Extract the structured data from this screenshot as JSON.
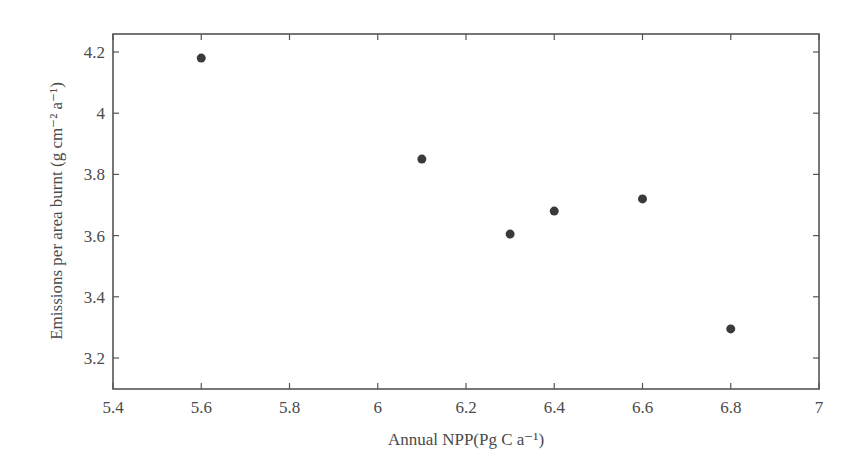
{
  "chart_data": {
    "type": "scatter",
    "title": "",
    "xlabel": "Annual NPP(Pg C a⁻¹)",
    "ylabel": "Emissions per area burnt  (g cm⁻² a⁻¹)",
    "xlim": [
      5.4,
      7.0
    ],
    "ylim": [
      3.1,
      4.25
    ],
    "xticks": [
      "5.4",
      "5.6",
      "5.8",
      "6",
      "6.2",
      "6.4",
      "6.6",
      "6.8",
      "7"
    ],
    "yticks": [
      "3.2",
      "3.4",
      "3.6",
      "3.8",
      "4",
      "4.2"
    ],
    "grid": false,
    "legend": null,
    "series": [
      {
        "name": "data",
        "x": [
          5.6,
          6.1,
          6.3,
          6.4,
          6.6,
          6.8
        ],
        "y": [
          4.18,
          3.85,
          3.605,
          3.68,
          3.72,
          3.295
        ]
      }
    ],
    "colors": {
      "marker": "#3a3a3a",
      "axis": "#555555"
    }
  }
}
